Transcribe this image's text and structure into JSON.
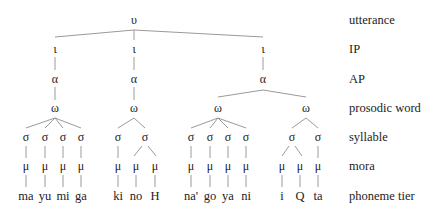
{
  "tiers": [
    {
      "symbol": "υ",
      "label": "utterance"
    },
    {
      "symbol": "ι",
      "label": "IP"
    },
    {
      "symbol": "α",
      "label": "AP"
    },
    {
      "symbol": "ω",
      "label": "prosodic word"
    },
    {
      "symbol": "σ",
      "label": "syllable"
    },
    {
      "symbol": "μ",
      "label": "mora"
    },
    {
      "symbol": "",
      "label": "phoneme tier"
    }
  ],
  "segments": [
    "ma",
    "yu",
    "mi",
    "ga",
    "ki",
    "no",
    "H",
    "na'",
    "go",
    "ya",
    "ni",
    "i",
    "Q",
    "ta"
  ],
  "colors": {
    "line": "#9a9a9a",
    "text": "#222222"
  }
}
